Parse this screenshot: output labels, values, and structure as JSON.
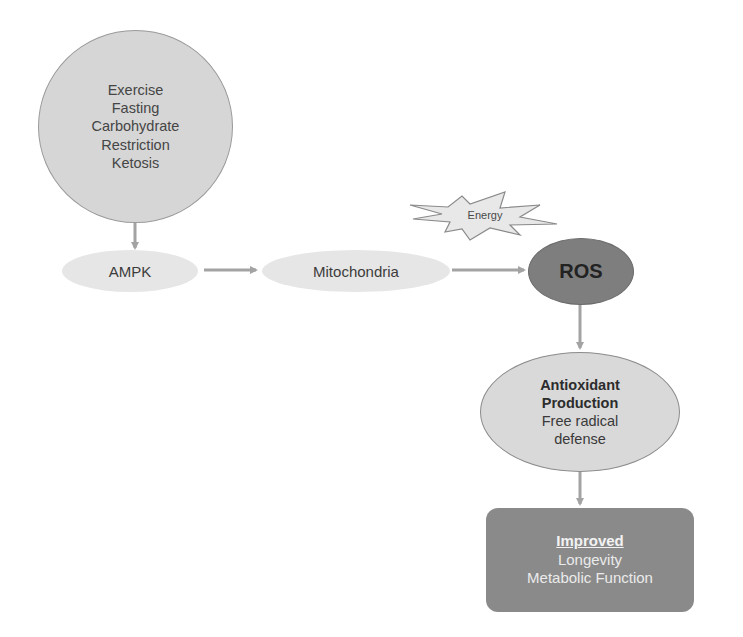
{
  "diagram": {
    "type": "flowchart",
    "colors": {
      "arrow": "#a3a3a3",
      "inputs_fill": "#d6d6d6",
      "light_ellipse_fill": "#e6e6e6",
      "ros_fill": "#7e7e7e",
      "antioxidant_fill": "#d9d9d9",
      "outcome_fill": "#8a8a8a",
      "energy_fill": "#e8e8e8"
    },
    "nodes": {
      "inputs": {
        "lines": [
          "Exercise",
          "Fasting",
          "Carbohydrate",
          "Restriction",
          "Ketosis"
        ]
      },
      "ampk": {
        "label": "AMPK"
      },
      "mitochondria": {
        "label": "Mitochondria"
      },
      "energy": {
        "label": "Energy"
      },
      "ros": {
        "label": "ROS"
      },
      "antioxidant": {
        "title_lines": [
          "Antioxidant",
          "Production"
        ],
        "body_lines": [
          "Free radical",
          "defense"
        ]
      },
      "outcome": {
        "title": "Improved",
        "lines": [
          "Longevity",
          "Metabolic Function"
        ]
      }
    },
    "edges": [
      {
        "from": "inputs",
        "to": "ampk"
      },
      {
        "from": "ampk",
        "to": "mitochondria"
      },
      {
        "from": "mitochondria",
        "to": "ros"
      },
      {
        "from": "ros",
        "to": "antioxidant"
      },
      {
        "from": "antioxidant",
        "to": "outcome"
      }
    ]
  }
}
